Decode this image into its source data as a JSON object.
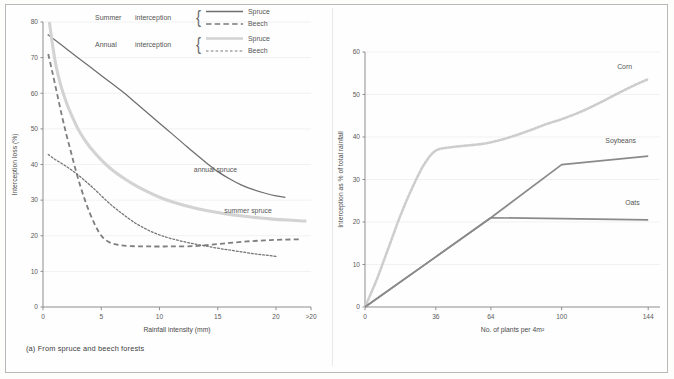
{
  "figure": {
    "panels": [
      {
        "id": "a",
        "caption": "(a) From spruce and beech forests",
        "xlabel": "Rainfall intensity (mm)",
        "ylabel": "Interception loss (%)"
      },
      {
        "id": "b",
        "caption": "(b) By three agricultural crops",
        "xlabel": "No. of plants per 4m²",
        "ylabel": "Interception as % of total rainfall"
      }
    ]
  },
  "legend": {
    "groups": [
      {
        "head": "Summer",
        "word": "interception",
        "brace": "{",
        "entries": [
          {
            "label": "Spruce",
            "style": "solid-dark",
            "color": "#6e6e6e"
          },
          {
            "label": "Beech",
            "style": "dashed-dark",
            "color": "#7a7a7a"
          }
        ]
      },
      {
        "head": "Annual",
        "word": "interception",
        "brace": "{",
        "entries": [
          {
            "label": "Spruce",
            "style": "solid-light",
            "color": "#d2d2d2"
          },
          {
            "label": "Beech",
            "style": "dotted-dark",
            "color": "#7a7a7a"
          }
        ]
      }
    ]
  },
  "colors": {
    "dark_line": "#6e6e6e",
    "light_line": "#d3d3d3",
    "beech_dash": "#7e7e7e",
    "beech_dot": "#737373",
    "axis": "#8d8d8d",
    "grid": "#f1f1f1",
    "text": "#555555",
    "frame": "#b9b9b9",
    "background": "#fefefe"
  },
  "chart_data": [
    {
      "type": "line",
      "panel": "a",
      "title": "(a) From spruce and beech forests",
      "xlabel": "Rainfall intensity (mm)",
      "ylabel": "Interception loss (%)",
      "xlim": [
        0,
        23
      ],
      "ylim": [
        0,
        80
      ],
      "xticks": [
        0,
        5,
        10,
        15,
        20,
        23
      ],
      "xtick_labels": [
        "0",
        "5",
        "10",
        "15",
        "20",
        ">20"
      ],
      "yticks": [
        0,
        10,
        20,
        30,
        40,
        50,
        60,
        70,
        80
      ],
      "ytick_labels": [
        "0",
        "10",
        "20",
        "30",
        "40",
        "50",
        "60",
        "70",
        "80"
      ],
      "grid": "horizontal-faint",
      "legend_position": "top-center",
      "annotations": [
        {
          "text": "annual spruce",
          "x": 14.8,
          "y": 38.0
        },
        {
          "text": "summer spruce",
          "x": 17.6,
          "y": 26.5
        }
      ],
      "series": [
        {
          "name": "annual spruce",
          "legend": "Summer interception – Spruce",
          "style": "solid",
          "color": "#6e6e6e",
          "points": [
            [
              0.4,
              76.5
            ],
            [
              1.0,
              75.0
            ],
            [
              2.0,
              72.5
            ],
            [
              3.0,
              70.0
            ],
            [
              4.0,
              67.5
            ],
            [
              5.0,
              65.0
            ],
            [
              6.0,
              62.5
            ],
            [
              7.0,
              60.0
            ],
            [
              8.0,
              57.2
            ],
            [
              9.0,
              54.4
            ],
            [
              10.0,
              51.6
            ],
            [
              11.0,
              48.8
            ],
            [
              12.0,
              46.0
            ],
            [
              13.0,
              43.2
            ],
            [
              14.0,
              40.5
            ],
            [
              15.0,
              38.0
            ],
            [
              16.0,
              36.0
            ],
            [
              17.0,
              34.3
            ],
            [
              18.0,
              33.0
            ],
            [
              19.0,
              32.0
            ],
            [
              20.0,
              31.2
            ],
            [
              20.8,
              30.8
            ]
          ]
        },
        {
          "name": "summer spruce",
          "legend": "Annual interception – Spruce",
          "style": "solid",
          "color": "#d3d3d3",
          "points": [
            [
              0.55,
              80.0
            ],
            [
              0.8,
              74.0
            ],
            [
              1.1,
              68.0
            ],
            [
              1.5,
              62.5
            ],
            [
              2.0,
              57.5
            ],
            [
              2.5,
              53.5
            ],
            [
              3.0,
              50.0
            ],
            [
              3.5,
              47.3
            ],
            [
              4.0,
              45.0
            ],
            [
              5.0,
              41.3
            ],
            [
              6.0,
              38.3
            ],
            [
              7.0,
              36.0
            ],
            [
              8.0,
              34.0
            ],
            [
              9.0,
              32.3
            ],
            [
              10.0,
              30.8
            ],
            [
              11.0,
              29.6
            ],
            [
              12.0,
              28.6
            ],
            [
              13.0,
              27.8
            ],
            [
              14.0,
              27.1
            ],
            [
              15.0,
              26.5
            ],
            [
              16.0,
              26.0
            ],
            [
              17.0,
              25.6
            ],
            [
              18.0,
              25.2
            ],
            [
              19.0,
              24.9
            ],
            [
              20.0,
              24.6
            ],
            [
              21.0,
              24.4
            ],
            [
              22.0,
              24.2
            ],
            [
              22.6,
              24.1
            ]
          ]
        },
        {
          "name": "summer beech",
          "legend": "Summer interception – Beech",
          "style": "dashed",
          "color": "#7e7e7e",
          "points": [
            [
              0.45,
              71.0
            ],
            [
              0.8,
              66.0
            ],
            [
              1.2,
              60.0
            ],
            [
              1.6,
              54.0
            ],
            [
              2.0,
              48.5
            ],
            [
              2.4,
              43.5
            ],
            [
              2.8,
              38.5
            ],
            [
              3.2,
              34.0
            ],
            [
              3.6,
              30.0
            ],
            [
              4.0,
              26.5
            ],
            [
              4.4,
              23.5
            ],
            [
              4.8,
              21.0
            ],
            [
              5.2,
              19.3
            ],
            [
              5.8,
              18.0
            ],
            [
              6.5,
              17.4
            ],
            [
              7.5,
              17.1
            ],
            [
              9.0,
              17.0
            ],
            [
              11.0,
              17.0
            ],
            [
              13.0,
              17.1
            ],
            [
              14.5,
              17.5
            ],
            [
              16.0,
              18.0
            ],
            [
              17.5,
              18.4
            ],
            [
              19.0,
              18.7
            ],
            [
              20.5,
              18.9
            ],
            [
              22.2,
              19.0
            ]
          ]
        },
        {
          "name": "annual beech",
          "legend": "Annual interception – Beech",
          "style": "dotted",
          "color": "#737373",
          "points": [
            [
              0.45,
              42.8
            ],
            [
              1.0,
              41.5
            ],
            [
              1.6,
              40.3
            ],
            [
              2.2,
              39.0
            ],
            [
              2.8,
              37.6
            ],
            [
              3.4,
              36.0
            ],
            [
              4.0,
              34.3
            ],
            [
              4.6,
              32.5
            ],
            [
              5.2,
              30.6
            ],
            [
              5.8,
              28.8
            ],
            [
              6.4,
              27.2
            ],
            [
              7.0,
              25.7
            ],
            [
              7.8,
              23.8
            ],
            [
              8.6,
              22.3
            ],
            [
              9.4,
              21.0
            ],
            [
              10.2,
              20.0
            ],
            [
              11.0,
              19.2
            ],
            [
              12.0,
              18.4
            ],
            [
              13.0,
              17.7
            ],
            [
              14.0,
              17.1
            ],
            [
              15.0,
              16.5
            ],
            [
              16.0,
              16.0
            ],
            [
              17.0,
              15.5
            ],
            [
              18.0,
              15.0
            ],
            [
              19.0,
              14.6
            ],
            [
              20.0,
              14.2
            ]
          ]
        }
      ]
    },
    {
      "type": "line",
      "panel": "b",
      "title": "(b) By three agricultural crops",
      "xlabel": "No. of plants per 4m²",
      "ylabel": "Interception as % of total rainfall",
      "xlim": [
        0,
        150
      ],
      "ylim": [
        0,
        60
      ],
      "xticks": [
        0,
        36,
        64,
        100,
        144
      ],
      "xtick_labels": [
        "0",
        "36",
        "64",
        "100",
        "144"
      ],
      "yticks": [
        0,
        10,
        20,
        30,
        40,
        50,
        60
      ],
      "ytick_labels": [
        "0",
        "10",
        "20",
        "30",
        "40",
        "50",
        "60"
      ],
      "grid": "horizontal-faint",
      "legend_position": "inline-labels",
      "annotations": [
        {
          "text": "Corn",
          "x": 132,
          "y": 56.0
        },
        {
          "text": "Soybeans",
          "x": 130,
          "y": 38.5
        },
        {
          "text": "Oats",
          "x": 136,
          "y": 24.0
        }
      ],
      "series": [
        {
          "name": "Corn",
          "style": "dotted",
          "color": "#cdcdcd",
          "points": [
            [
              0,
              0
            ],
            [
              6,
              6.5
            ],
            [
              12,
              14.0
            ],
            [
              18,
              21.5
            ],
            [
              24,
              28.0
            ],
            [
              30,
              33.5
            ],
            [
              36,
              36.8
            ],
            [
              44,
              37.6
            ],
            [
              52,
              38.0
            ],
            [
              60,
              38.4
            ],
            [
              68,
              39.2
            ],
            [
              76,
              40.3
            ],
            [
              84,
              41.6
            ],
            [
              92,
              43.0
            ],
            [
              100,
              44.2
            ],
            [
              110,
              46.0
            ],
            [
              120,
              48.2
            ],
            [
              130,
              50.6
            ],
            [
              138,
              52.4
            ],
            [
              144,
              53.6
            ]
          ]
        },
        {
          "name": "Soybeans",
          "style": "solid",
          "color": "#8a8a8a",
          "points": [
            [
              0,
              0
            ],
            [
              36,
              11.8
            ],
            [
              64,
              21.0
            ],
            [
              100,
              33.5
            ],
            [
              144,
              35.5
            ]
          ]
        },
        {
          "name": "Oats",
          "style": "solid",
          "color": "#8a8a8a",
          "points": [
            [
              0,
              0
            ],
            [
              36,
              11.8
            ],
            [
              64,
              21.0
            ],
            [
              100,
              20.8
            ],
            [
              144,
              20.5
            ]
          ]
        }
      ]
    }
  ]
}
